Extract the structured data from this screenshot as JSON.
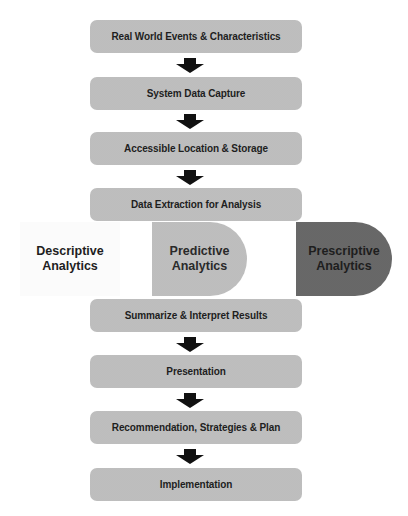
{
  "steps": [
    {
      "label": "Real World Events & Characteristics",
      "top": 20
    },
    {
      "label": "System Data Capture",
      "top": 77
    },
    {
      "label": "Accessible Location & Storage",
      "top": 132
    },
    {
      "label": "Data Extraction for Analysis",
      "top": 188
    },
    {
      "label": "Summarize & Interpret Results",
      "top": 299
    },
    {
      "label": "Presentation",
      "top": 355
    },
    {
      "label": "Recommendation, Strategies & Plan",
      "top": 411
    },
    {
      "label": "Implementation",
      "top": 468
    }
  ],
  "analytics": {
    "descriptive": {
      "line1": "Descriptive",
      "line2": "Analytics"
    },
    "predictive": {
      "line1": "Predictive",
      "line2": "Analytics"
    },
    "prescriptive": {
      "line1": "Prescriptive",
      "line2": "Analytics"
    }
  },
  "colors": {
    "box_fill": "#c6c6c6",
    "prescriptive_fill": "#6f6f6f",
    "descriptive_fill": "#fbfbfb",
    "arrow": "#111111"
  }
}
